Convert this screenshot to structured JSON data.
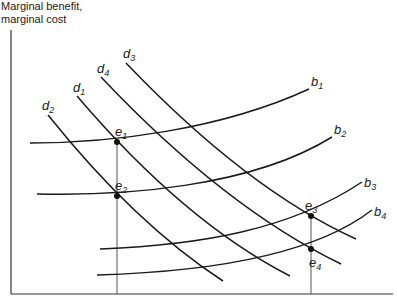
{
  "diagram": {
    "y_axis_label_line1": "Marginal benefit,",
    "y_axis_label_line2": "marginal cost",
    "benefit_curves": [
      {
        "name": "b",
        "sub": "1",
        "path": "M30,143 C110,143 220,130 309,89",
        "lx": 311,
        "ly": 86
      },
      {
        "name": "b",
        "sub": "2",
        "path": "M37,194 C120,196 250,188 332,137",
        "lx": 334,
        "ly": 134
      },
      {
        "name": "b",
        "sub": "3",
        "path": "M100,249 C200,245 290,230 362,182",
        "lx": 364,
        "ly": 187
      },
      {
        "name": "b",
        "sub": "4",
        "path": "M97,275 C200,272 310,258 372,210",
        "lx": 374,
        "ly": 216
      }
    ],
    "demand_curves": [
      {
        "name": "d",
        "sub": "2",
        "path": "M48,115 C100,180 160,240 223,281",
        "lx": 42,
        "ly": 110
      },
      {
        "name": "d",
        "sub": "1",
        "path": "M77,96 C140,170 210,235 290,276",
        "lx": 73,
        "ly": 92
      },
      {
        "name": "d",
        "sub": "4",
        "path": "M101,77 C170,150 250,220 341,264",
        "lx": 97,
        "ly": 73
      },
      {
        "name": "d",
        "sub": "3",
        "path": "M126,63 C190,130 270,200 356,239",
        "lx": 123,
        "ly": 58
      }
    ],
    "equilibria": [
      {
        "name": "e",
        "sub": "1",
        "x": 117,
        "y": 142,
        "lx": 115,
        "ly": 136
      },
      {
        "name": "e",
        "sub": "2",
        "x": 117,
        "y": 196,
        "lx": 115,
        "ly": 190
      },
      {
        "name": "e",
        "sub": "3",
        "x": 311,
        "y": 216,
        "lx": 305,
        "ly": 210
      },
      {
        "name": "e",
        "sub": "4",
        "x": 311,
        "y": 249,
        "lx": 309,
        "ly": 267
      }
    ],
    "guides_x": [
      117,
      311
    ],
    "colors": {
      "curve": "#1a1a1a",
      "axis": "#333333",
      "guide": "#555555"
    }
  }
}
